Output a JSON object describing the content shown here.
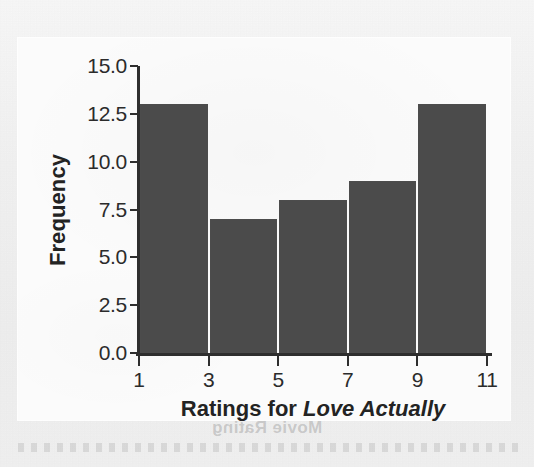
{
  "figure": {
    "y_axis_title": "Frequency",
    "x_axis_title_prefix": "Ratings for ",
    "x_axis_title_emphasis": "Love Actually",
    "bleed_through_text": "Movie Rating",
    "bar_color": "#4b4b4b",
    "axis_color": "#2e2e2e",
    "panel_color": "#fbfbfb",
    "page_color": "#f1f1f1"
  },
  "chart_data": {
    "type": "bar",
    "title": "",
    "subtitle": "",
    "xlabel": "Ratings for Love Actually",
    "ylabel": "Frequency",
    "categories": [
      "1-3",
      "3-5",
      "5-7",
      "7-9",
      "9-11"
    ],
    "bin_edges": [
      1,
      3,
      5,
      7,
      9,
      11
    ],
    "values": [
      13,
      7,
      8,
      9,
      13
    ],
    "xlim": [
      1,
      11
    ],
    "ylim": [
      0,
      15
    ],
    "xticks": [
      1,
      3,
      5,
      7,
      9,
      11
    ],
    "xtick_labels": [
      "1",
      "3",
      "5",
      "7",
      "9",
      "11"
    ],
    "yticks": [
      0.0,
      2.5,
      5.0,
      7.5,
      10.0,
      12.5,
      15.0
    ],
    "ytick_labels": [
      "0.0",
      "2.5",
      "5.0",
      "7.5",
      "10.0",
      "12.5",
      "15.0"
    ],
    "grid": false,
    "legend": null,
    "annotations": []
  }
}
